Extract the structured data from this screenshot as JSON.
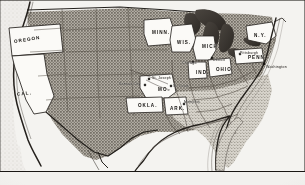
{
  "figure": {
    "name": "united-states-map",
    "kind": "engraved halftone map of the United States",
    "paper_color": "#f2f1ee",
    "ink_color": "#1a1714",
    "land_fill": "#b9b5ad",
    "highlight_fill": "#fbfaf7",
    "water_fill": "#403b36",
    "frame_color": "#1a1714"
  },
  "states": [
    {
      "id": "oregon",
      "label": "OREGON",
      "size": "state",
      "x": 14,
      "y": 38,
      "rot": -9
    },
    {
      "id": "california",
      "label": "CAL.",
      "size": "state",
      "x": 17,
      "y": 92,
      "rot": -6
    },
    {
      "id": "minnesota",
      "label": "MINN.",
      "size": "state",
      "x": 152,
      "y": 31,
      "rot": 0
    },
    {
      "id": "wisconsin",
      "label": "WIS.",
      "size": "state",
      "x": 177,
      "y": 41,
      "rot": 0
    },
    {
      "id": "michigan",
      "label": "MICH.",
      "size": "state",
      "x": 202,
      "y": 45,
      "rot": 0
    },
    {
      "id": "new-york",
      "label": "N.Y.",
      "size": "state",
      "x": 254,
      "y": 34,
      "rot": 0
    },
    {
      "id": "pennsylvania",
      "label": "PENN.",
      "size": "state",
      "x": 248,
      "y": 56,
      "rot": 0
    },
    {
      "id": "ohio",
      "label": "OHIO",
      "size": "state",
      "x": 216,
      "y": 68,
      "rot": 0
    },
    {
      "id": "indiana",
      "label": "IND.",
      "size": "state",
      "x": 196,
      "y": 71,
      "rot": 0
    },
    {
      "id": "missouri",
      "label": "MO.",
      "size": "state",
      "x": 158,
      "y": 88,
      "rot": 0
    },
    {
      "id": "oklahoma",
      "label": "OKLA.",
      "size": "state",
      "x": 138,
      "y": 104,
      "rot": 0
    },
    {
      "id": "arkansas",
      "label": "ARK.",
      "size": "state",
      "x": 170,
      "y": 107,
      "rot": 0
    }
  ],
  "cities": [
    {
      "id": "st-joseph",
      "label": "St. Joseph",
      "label_x": 152,
      "label_y": 77,
      "dot_x": 148,
      "dot_y": 78
    },
    {
      "id": "kansas-city",
      "label": "Kansas City",
      "label_x": 119,
      "label_y": 83,
      "dot_x": 144,
      "dot_y": 84
    },
    {
      "id": "st-louis",
      "label": "St. Louis",
      "label_x": 173,
      "label_y": 85,
      "dot_x": 170,
      "dot_y": 85
    },
    {
      "id": "chicago",
      "label": "Chicago",
      "label_x": 182,
      "label_y": 62,
      "dot_x": 192,
      "dot_y": 61
    },
    {
      "id": "detroit",
      "label": "Detroit",
      "label_x": 213,
      "label_y": 59,
      "dot_x": 211,
      "dot_y": 57
    },
    {
      "id": "memphis",
      "label": "Memphis",
      "label_x": 184,
      "label_y": 101,
      "dot_x": 183,
      "dot_y": 103
    },
    {
      "id": "washington",
      "label": "Washington",
      "label_x": 266,
      "label_y": 66,
      "dot_x": 263,
      "dot_y": 63
    },
    {
      "id": "pittsburgh",
      "label": "Pittsburgh",
      "label_x": 240,
      "label_y": 52,
      "dot_x": 239,
      "dot_y": 53
    }
  ]
}
